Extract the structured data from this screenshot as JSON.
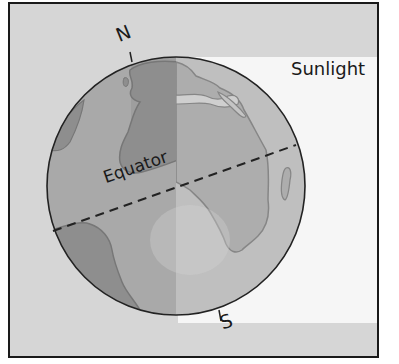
{
  "diagram": {
    "type": "earth-tilt-sunlight",
    "labels": {
      "sunlight": "Sunlight",
      "north": "N",
      "south": "S",
      "equator": "Equator"
    },
    "colors": {
      "background": "#d6d6d6",
      "sunlight_band": "#f6f6f6",
      "globe_night": "#a8a8a8",
      "globe_day": "#bdbdbd",
      "land_night": "#8c8c8c",
      "land_day": "#a9a9a9",
      "outline": "#222222"
    }
  }
}
